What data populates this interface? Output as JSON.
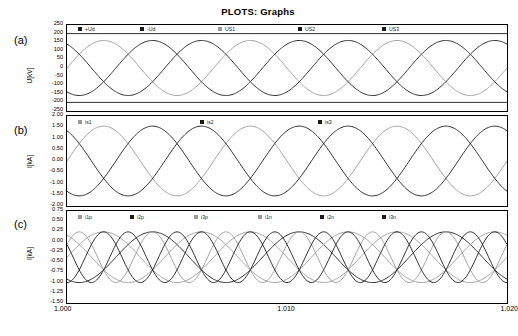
{
  "title": "PLOTS: Graphs",
  "axis": {
    "x_ticks": [
      "1.000",
      "1.010",
      "1.020"
    ],
    "x_min": 1.0,
    "x_max": 1.02
  },
  "panels": [
    {
      "id": "a",
      "label": "(a)",
      "ylabel": "U[kV]",
      "y_ticks": [
        "250",
        "200",
        "150",
        "100",
        "50",
        "0",
        "-50",
        "-100",
        "-150",
        "-200",
        "-250"
      ],
      "y_min": -250,
      "y_max": 250,
      "legend": [
        {
          "name": "+Ud",
          "color": "#1a1a1a"
        },
        {
          "name": "-Ud",
          "color": "#1a1a1a"
        },
        {
          "name": "US1",
          "color": "#999999"
        },
        {
          "name": "US2",
          "color": "#1a1a1a"
        },
        {
          "name": "US3",
          "color": "#1a1a1a"
        }
      ]
    },
    {
      "id": "b",
      "label": "(b)",
      "ylabel": "I[kA]",
      "y_ticks": [
        "2.00",
        "1.50",
        "1.00",
        "0.50",
        "0.00",
        "-0.50",
        "-1.00",
        "-1.50",
        "-2.00"
      ],
      "y_min": -2.0,
      "y_max": 2.0,
      "legend": [
        {
          "name": "is1",
          "color": "#999999"
        },
        {
          "name": "is2",
          "color": "#1a1a1a"
        },
        {
          "name": "is3",
          "color": "#1a1a1a"
        }
      ]
    },
    {
      "id": "c",
      "label": "(c)",
      "ylabel": "I[kA]",
      "y_ticks": [
        "0.75",
        "0.50",
        "0.25",
        "0.00",
        "-0.25",
        "-0.50",
        "-0.75",
        "-1.00",
        "-1.25",
        "-1.50"
      ],
      "y_min": -1.5,
      "y_max": 0.75,
      "legend": [
        {
          "name": "i1p",
          "color": "#999999"
        },
        {
          "name": "i2p",
          "color": "#1a1a1a"
        },
        {
          "name": "i3p",
          "color": "#999999"
        },
        {
          "name": "i1n",
          "color": "#999999"
        },
        {
          "name": "i2n",
          "color": "#1a1a1a"
        },
        {
          "name": "i3n",
          "color": "#1a1a1a"
        }
      ]
    }
  ],
  "chart_data": {
    "type": "line",
    "title": "PLOTS: Graphs",
    "xlabel": "",
    "x": [
      1.0,
      1.02
    ],
    "xlim": [
      1.0,
      1.02
    ],
    "x_tick_labels": [
      "1.000",
      "1.010",
      "1.020"
    ],
    "subplots": [
      {
        "panel": "a",
        "ylabel": "U[kV]",
        "ylim": [
          -250,
          250
        ],
        "y_tick_labels": [
          "250",
          "200",
          "150",
          "100",
          "50",
          "0",
          "-50",
          "-100",
          "-150",
          "-200",
          "-250"
        ],
        "grid": false,
        "series": [
          {
            "name": "+Ud",
            "type": "constant",
            "value": 200,
            "color": "#1a1a1a"
          },
          {
            "name": "-Ud",
            "type": "constant",
            "value": -200,
            "color": "#1a1a1a"
          },
          {
            "name": "US1",
            "type": "sine",
            "amplitude": 160,
            "frequency_cycles": 3,
            "phase_deg": 0,
            "offset": 0,
            "color": "#999999"
          },
          {
            "name": "US2",
            "type": "sine",
            "amplitude": 160,
            "frequency_cycles": 3,
            "phase_deg": -120,
            "offset": 0,
            "color": "#1a1a1a"
          },
          {
            "name": "US3",
            "type": "sine",
            "amplitude": 160,
            "frequency_cycles": 3,
            "phase_deg": 120,
            "offset": 0,
            "color": "#1a1a1a"
          }
        ]
      },
      {
        "panel": "b",
        "ylabel": "I[kA]",
        "ylim": [
          -2.0,
          2.0
        ],
        "y_tick_labels": [
          "2.00",
          "1.50",
          "1.00",
          "0.50",
          "0.00",
          "-0.50",
          "-1.00",
          "-1.50",
          "-2.00"
        ],
        "grid": false,
        "series": [
          {
            "name": "is1",
            "type": "sine",
            "amplitude": 1.55,
            "frequency_cycles": 3,
            "phase_deg": 0,
            "offset": 0,
            "color": "#999999"
          },
          {
            "name": "is2",
            "type": "sine",
            "amplitude": 1.55,
            "frequency_cycles": 3,
            "phase_deg": -120,
            "offset": 0,
            "color": "#1a1a1a"
          },
          {
            "name": "is3",
            "type": "sine",
            "amplitude": 1.55,
            "frequency_cycles": 3,
            "phase_deg": 120,
            "offset": 0,
            "color": "#1a1a1a"
          }
        ]
      },
      {
        "panel": "c",
        "ylabel": "I[kA]",
        "ylim": [
          -1.5,
          0.75
        ],
        "y_tick_labels": [
          "0.75",
          "0.50",
          "0.25",
          "0.00",
          "-0.25",
          "-0.50",
          "-0.75",
          "-1.00",
          "-1.25",
          "-1.50"
        ],
        "grid": false,
        "series": [
          {
            "name": "i1p",
            "type": "sine",
            "amplitude": 0.62,
            "frequency_cycles": 3,
            "phase_deg": 0,
            "offset": -0.38,
            "color": "#999999"
          },
          {
            "name": "i2p",
            "type": "sine",
            "amplitude": 0.62,
            "frequency_cycles": 3,
            "phase_deg": -120,
            "offset": -0.38,
            "color": "#1a1a1a"
          },
          {
            "name": "i3p",
            "type": "sine",
            "amplitude": 0.62,
            "frequency_cycles": 3,
            "phase_deg": 120,
            "offset": -0.38,
            "color": "#999999"
          },
          {
            "name": "i1n",
            "type": "sine",
            "amplitude": 0.62,
            "frequency_cycles": 6,
            "phase_deg": 30,
            "offset": -0.38,
            "color": "#999999"
          },
          {
            "name": "i2n",
            "type": "sine",
            "amplitude": 0.62,
            "frequency_cycles": 6,
            "phase_deg": 150,
            "offset": -0.38,
            "color": "#1a1a1a"
          },
          {
            "name": "i3n",
            "type": "sine",
            "amplitude": 0.62,
            "frequency_cycles": 6,
            "phase_deg": 270,
            "offset": -0.38,
            "color": "#1a1a1a"
          }
        ]
      }
    ]
  }
}
